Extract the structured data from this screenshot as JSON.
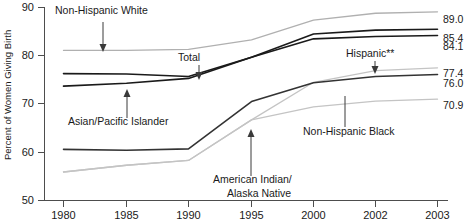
{
  "chart_data": {
    "type": "line",
    "title": "",
    "xlabel": "",
    "ylabel": "Percent of Women Giving Birth",
    "ylim": [
      50,
      90
    ],
    "yticks": [
      50,
      60,
      70,
      80,
      90
    ],
    "ytick_labels": [
      "50",
      "60",
      "70",
      "80",
      "90"
    ],
    "x": [
      1980,
      1985,
      1990,
      1995,
      2000,
      2002,
      2003
    ],
    "xtick_labels": [
      "1980",
      "1985",
      "1990",
      "1995",
      "2000",
      "2002",
      "2003"
    ],
    "grid": false,
    "legend_position": "annotations",
    "series": [
      {
        "name": "Non-Hispanic White",
        "color": "#b0b0b0",
        "end_value": "89.0",
        "values": [
          81.0,
          81.0,
          81.2,
          83.2,
          87.3,
          88.7,
          89.0
        ]
      },
      {
        "name": "Asian/Pacific Islander",
        "color": "#1a1a1a",
        "end_value": "85.4",
        "values": [
          76.2,
          76.1,
          75.6,
          79.6,
          84.4,
          85.2,
          85.4
        ]
      },
      {
        "name": "Total",
        "color": "#1a1a1a",
        "end_value": "84.1",
        "values": [
          73.6,
          74.2,
          75.2,
          79.6,
          83.4,
          83.9,
          84.1
        ]
      },
      {
        "name": "Hispanic**",
        "color": "#c4c4c4",
        "end_value": "77.4",
        "values": [
          55.8,
          57.2,
          58.2,
          66.6,
          74.4,
          76.8,
          77.4
        ]
      },
      {
        "name": "Non-Hispanic Black",
        "color": "#333333",
        "end_value": "76.0",
        "values": [
          60.5,
          60.3,
          60.6,
          70.4,
          74.3,
          75.6,
          76.0
        ]
      },
      {
        "name": "American Indian/Alaska Native",
        "color": "#c4c4c4",
        "end_value": "70.9",
        "values": [
          55.8,
          57.2,
          58.2,
          66.6,
          69.3,
          70.5,
          70.9
        ]
      }
    ],
    "value_labels": [
      {
        "text": "89.0",
        "y": 19
      },
      {
        "text": "85.4",
        "y": 38
      },
      {
        "text": "84.1",
        "y": 46
      },
      {
        "text": "77.4",
        "y": 73
      },
      {
        "text": "76.0",
        "y": 83
      },
      {
        "text": "70.9",
        "y": 105
      }
    ],
    "annotations": [
      {
        "label": "Non-Hispanic White",
        "x": 55,
        "y": 14,
        "arrow": "down"
      },
      {
        "label": "Total",
        "x": 178,
        "y": 61,
        "arrow": "down"
      },
      {
        "label": "Hispanic**",
        "x": 346,
        "y": 57,
        "arrow": "down"
      },
      {
        "label": "Asian/Pacific Islander",
        "x": 68,
        "y": 125,
        "arrow": "up"
      },
      {
        "label": "American Indian/",
        "x": 213,
        "y": 183,
        "arrow": "up"
      },
      {
        "label": "Alaska Native",
        "x": 227,
        "y": 197,
        "arrow": "none"
      },
      {
        "label": "Non-Hispanic Black",
        "x": 303,
        "y": 135,
        "arrow": "none"
      }
    ]
  }
}
